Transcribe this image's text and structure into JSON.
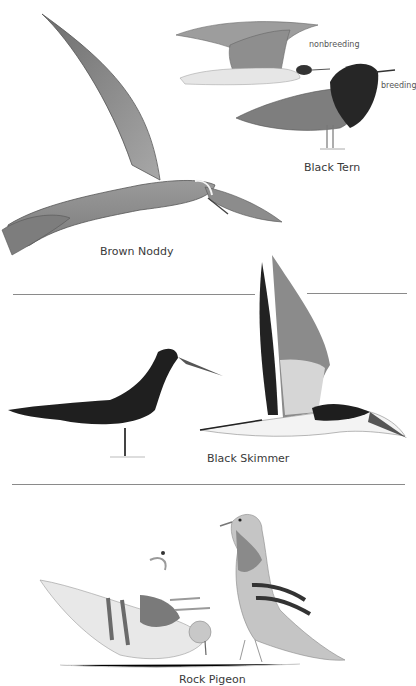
{
  "page": {
    "species": [
      {
        "name": "Brown Noddy"
      },
      {
        "name": "Black Tern",
        "plumage_labels": [
          "nonbreeding",
          "breeding"
        ]
      },
      {
        "name": "Black Skimmer"
      },
      {
        "name": "Rock Pigeon"
      }
    ]
  }
}
